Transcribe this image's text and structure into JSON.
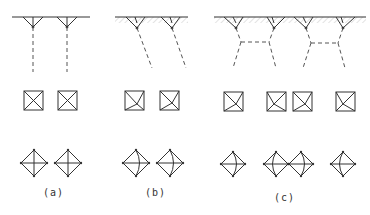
{
  "panels": [
    {
      "label": "(a)",
      "x": 58
    },
    {
      "label": "(b)",
      "x": 158
    },
    {
      "label": "(c)",
      "x": 287
    }
  ],
  "colors": {
    "line": "#333333",
    "hatch": "#bbbbbb",
    "dash": "#555555"
  }
}
